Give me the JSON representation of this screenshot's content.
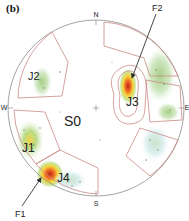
{
  "panel_label": "(b)",
  "compass": {
    "north": "N",
    "south": "S",
    "west": "W",
    "east": "E"
  },
  "domains": {
    "S0": "S0",
    "J1": "J1",
    "J2": "J2",
    "J3": "J3",
    "J4": "J4"
  },
  "annotations": {
    "F1": "F1",
    "F2": "F2"
  },
  "colors": {
    "boundary": "#c98a84",
    "circle": "#8c8c8c",
    "arrow": "#333333",
    "hot": "#e03a1a",
    "warm": "#f2c230",
    "green": "#a9d18e",
    "cool": "#d8ecf0"
  }
}
